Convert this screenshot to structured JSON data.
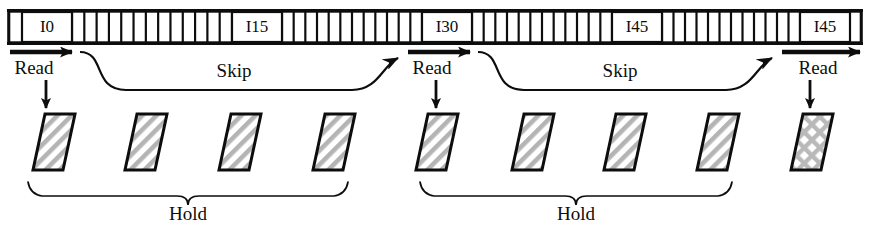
{
  "diagram": {
    "colors": {
      "ink": "#0d0d0d",
      "background": "#ffffff",
      "hatch": "#b4b4b4",
      "frame_fill": "#ffffff"
    },
    "tape": {
      "name": "instruction-tape",
      "x": 8,
      "y": 12,
      "width": 854,
      "height": 30,
      "rail_thickness": 3,
      "labeled_cells": [
        {
          "label": "I0",
          "x": 22,
          "width": 50
        },
        {
          "label": "I15",
          "x": 232,
          "width": 50
        },
        {
          "label": "I30",
          "x": 422,
          "width": 50
        },
        {
          "label": "I45",
          "x": 612,
          "width": 50
        },
        {
          "label": "I45",
          "x": 800,
          "width": 50
        }
      ],
      "tick_groups": [
        {
          "from": 72,
          "to": 232,
          "count": 13
        },
        {
          "from": 282,
          "to": 422,
          "count": 12
        },
        {
          "from": 472,
          "to": 612,
          "count": 12
        },
        {
          "from": 662,
          "to": 800,
          "count": 12
        }
      ]
    },
    "read_arrows": [
      {
        "label": "Read",
        "arrow_x1": 10,
        "arrow_x2": 78,
        "arrow_y": 52,
        "label_x": 34,
        "label_y": 70,
        "down_arrow_x": 46,
        "down_arrow_y1": 80,
        "down_arrow_y2": 112
      },
      {
        "label": "Read",
        "arrow_x1": 408,
        "arrow_x2": 476,
        "arrow_y": 52,
        "label_x": 432,
        "label_y": 70,
        "down_arrow_x": 436,
        "down_arrow_y1": 80,
        "down_arrow_y2": 112
      },
      {
        "label": "Read",
        "arrow_x1": 782,
        "arrow_x2": 866,
        "arrow_y": 52,
        "label_x": 818,
        "label_y": 70,
        "down_arrow_x": 810,
        "down_arrow_y1": 80,
        "down_arrow_y2": 112
      }
    ],
    "skip_arcs": [
      {
        "label": "Skip",
        "start_x": 80,
        "end_x": 404,
        "top_y": 52,
        "bottom_y": 90,
        "label_x": 234,
        "label_y": 73
      },
      {
        "label": "Skip",
        "start_x": 478,
        "end_x": 778,
        "top_y": 52,
        "bottom_y": 90,
        "label_x": 620,
        "label_y": 73
      }
    ],
    "frames": [
      {
        "name": "frame-1",
        "center_x": 54,
        "pattern": "diagonal-hatch"
      },
      {
        "name": "frame-2",
        "center_x": 146,
        "pattern": "diagonal-hatch"
      },
      {
        "name": "frame-3",
        "center_x": 240,
        "pattern": "diagonal-hatch"
      },
      {
        "name": "frame-4",
        "center_x": 334,
        "pattern": "diagonal-hatch"
      },
      {
        "name": "frame-5",
        "center_x": 437,
        "pattern": "diagonal-hatch"
      },
      {
        "name": "frame-6",
        "center_x": 533,
        "pattern": "diagonal-hatch"
      },
      {
        "name": "frame-7",
        "center_x": 625,
        "pattern": "diagonal-hatch"
      },
      {
        "name": "frame-8",
        "center_x": 718,
        "pattern": "diagonal-hatch"
      },
      {
        "name": "frame-9",
        "center_x": 812,
        "pattern": "cross-hatch"
      }
    ],
    "frame_geometry": {
      "top_y": 114,
      "bottom_y": 170,
      "width": 30,
      "slant": 12
    },
    "braces": [
      {
        "label": "Hold",
        "left_x": 28,
        "right_x": 348,
        "y": 182,
        "depth": 14,
        "label_x": 188,
        "label_y": 216
      },
      {
        "label": "Hold",
        "left_x": 420,
        "right_x": 732,
        "y": 182,
        "depth": 14,
        "label_x": 576,
        "label_y": 216
      }
    ]
  }
}
